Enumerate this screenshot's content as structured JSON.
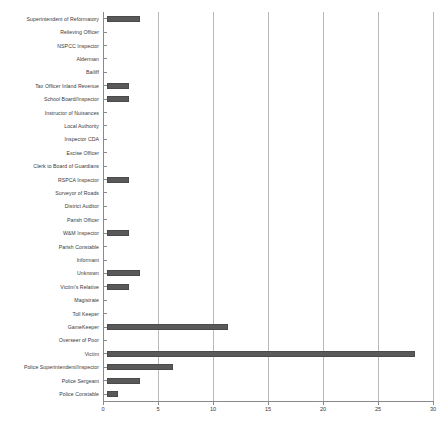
{
  "chart_data": {
    "type": "bar",
    "orientation": "horizontal",
    "title": "",
    "subtitle": "",
    "xlabel": "",
    "ylabel": "",
    "xlim": [
      0,
      30
    ],
    "ylim": null,
    "grid": true,
    "legend": false,
    "legend_position": "none",
    "xticks": [
      0,
      5,
      10,
      15,
      20,
      25,
      30
    ],
    "xtick_labels": [
      "0",
      "5",
      "10",
      "15",
      "20",
      "25",
      "30"
    ],
    "bar_color": "#595959",
    "gridline_color": "#b9b9b9",
    "axis_color": "#8a8a8a",
    "categories": [
      "Superintendent of Reformatory",
      "Relieving Officer",
      "NSPCC Inspector",
      "Alderman",
      "Bailiff",
      "Tax Officer Inland Revenue",
      "School Board/Inspector",
      "Instructor of Nuisances",
      "Local Authority",
      "Inspector CDA",
      "Excise Officer",
      "Clerk to Board of Guardians",
      "RSPCA Inspector",
      "Surveyor of Roads",
      "District Auditor",
      "Parish Officer",
      "W&M Inspector",
      "Parish Constable",
      "Informant",
      "Unknown",
      "Victim's Relative",
      "Magistrate",
      "Toll Keeper",
      "GameKeeper",
      "Overseer of Poor",
      "Victim",
      "Police Superintendent/Inspector",
      "Police Sergeant",
      "Police Constable"
    ],
    "values": [
      3,
      0,
      0,
      0,
      0,
      2,
      2,
      0,
      0,
      0,
      0,
      0,
      2,
      0,
      0,
      0,
      2,
      0,
      0,
      3,
      2,
      0,
      0,
      11,
      0,
      28,
      6,
      3,
      1
    ]
  }
}
